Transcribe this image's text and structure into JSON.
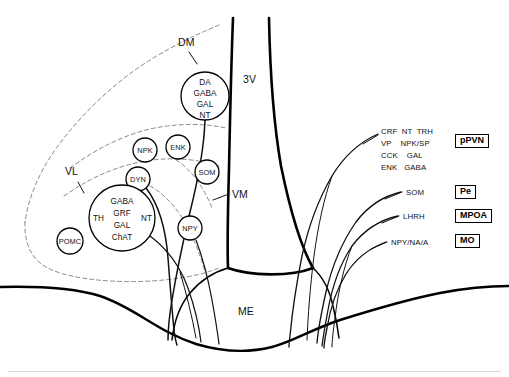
{
  "figure": {
    "type": "neuroanatomical-schematic"
  },
  "anatomical_labels": [
    {
      "id": "dm",
      "text": "DM",
      "x": 183,
      "y": 43,
      "desc": "dorsomedial arcuate subdivision"
    },
    {
      "id": "v3",
      "text": "3V",
      "x": 248,
      "y": 80,
      "desc": "third ventricle"
    },
    {
      "id": "vl",
      "text": "VL",
      "x": 70,
      "y": 172,
      "desc": "ventrolateral arcuate subdivision"
    },
    {
      "id": "vm",
      "text": "VM",
      "x": 232,
      "y": 195,
      "desc": "ventromedial arcuate subdivision"
    },
    {
      "id": "me",
      "text": "ME",
      "x": 243,
      "y": 312,
      "desc": "median eminence"
    }
  ],
  "cell_circles": [
    {
      "id": "da-gaba-gal-nt",
      "lines": [
        "DA",
        "GABA",
        "GAL",
        "NT"
      ],
      "cx": 205,
      "cy": 96,
      "r": 24
    },
    {
      "id": "npk",
      "lines": [
        "NPK"
      ],
      "cx": 145,
      "cy": 150,
      "r": 12
    },
    {
      "id": "enk",
      "lines": [
        "ENK"
      ],
      "cx": 178,
      "cy": 147,
      "r": 12
    },
    {
      "id": "som",
      "lines": [
        "SOM"
      ],
      "cx": 207,
      "cy": 172,
      "r": 12
    },
    {
      "id": "dyn",
      "lines": [
        "DYN"
      ],
      "cx": 138,
      "cy": 179,
      "r": 12
    },
    {
      "id": "npy",
      "lines": [
        "NPY"
      ],
      "cx": 190,
      "cy": 228,
      "r": 12
    },
    {
      "id": "pomc",
      "lines": [
        "POMC"
      ],
      "cx": 70,
      "cy": 241,
      "r": 13
    },
    {
      "id": "arcuate-main",
      "lines": [
        "GABA",
        "GRF",
        "GAL",
        "ChAT"
      ],
      "side_left": "TH",
      "side_right": "NT",
      "cx": 122,
      "cy": 218,
      "r": 33
    }
  ],
  "projection_labels": [
    {
      "id": "ppvn-block",
      "lines": [
        "CRF  NT  TRH",
        "VP    NPK/SP",
        "CCK    GAL",
        "ENK   GABA"
      ],
      "x": 381,
      "y": 128,
      "box": "pPVN",
      "box_x": 455,
      "box_y": 136
    },
    {
      "id": "pe-block",
      "lines": [
        "SOM"
      ],
      "x": 404,
      "y": 190,
      "box": "Pe",
      "box_x": 455,
      "box_y": 186
    },
    {
      "id": "mpoa-block",
      "lines": [
        "LHRH"
      ],
      "x": 401,
      "y": 214,
      "box": "MPOA",
      "box_x": 455,
      "box_y": 210
    },
    {
      "id": "mo-block",
      "lines": [
        "NPY/NA/A"
      ],
      "x": 389,
      "y": 240,
      "box": "MO",
      "box_x": 455,
      "box_y": 235
    }
  ],
  "region_boxes": [
    {
      "id": "pPVN",
      "text": "pPVN",
      "desc": "parvocellular paraventricular nucleus"
    },
    {
      "id": "Pe",
      "text": "Pe",
      "desc": "periventricular nucleus"
    },
    {
      "id": "MPOA",
      "text": "MPOA",
      "desc": "medial preoptic area"
    },
    {
      "id": "MO",
      "text": "MO",
      "desc": "medullary / brainstem origin"
    }
  ],
  "colors": {
    "ink": "#111111",
    "outline": "#000000",
    "dashed_boundary": "#8a8a8a",
    "fiber": "#1a1a1a",
    "background": "#ffffff",
    "bottom_rule": "#d8d8d8"
  }
}
